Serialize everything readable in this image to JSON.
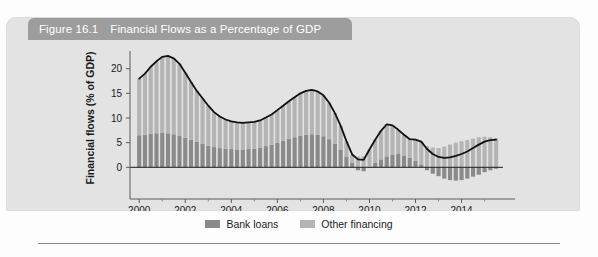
{
  "figure": {
    "number": "Figure 16.1",
    "title": "Financial Flows as a Percentage of GDP",
    "titlebar_color": "#9d9d9d",
    "card_color": "#e3e3e3"
  },
  "legend": {
    "position": "bottom-center",
    "items": [
      {
        "label": "Bank loans",
        "color": "#8a8a8a"
      },
      {
        "label": "Other financing",
        "color": "#b4b4b4"
      }
    ]
  },
  "chart_data": {
    "type": "bar",
    "stacked": true,
    "title": "Financial Flows as a Percentage of GDP",
    "xlabel": "",
    "ylabel": "Financial flows (% of GDP)",
    "xlim": [
      1999.6,
      2015.8
    ],
    "ylim": [
      -4,
      24
    ],
    "yticks": [
      0,
      5,
      10,
      15,
      20
    ],
    "ytick_labels": [
      "0",
      "5",
      "10",
      "15",
      "20"
    ],
    "xticks": [
      2000,
      2002,
      2004,
      2006,
      2008,
      2010,
      2012,
      2014
    ],
    "xtick_labels": [
      "2000",
      "2002",
      "2004",
      "2006",
      "2008",
      "2010",
      "2012",
      "2014"
    ],
    "grid": false,
    "zero_line": true,
    "overlay_line": {
      "name": "Total financial flows",
      "color": "#111111",
      "width": 1.8
    },
    "x": [
      2000.0,
      2000.25,
      2000.5,
      2000.75,
      2001.0,
      2001.25,
      2001.5,
      2001.75,
      2002.0,
      2002.25,
      2002.5,
      2002.75,
      2003.0,
      2003.25,
      2003.5,
      2003.75,
      2004.0,
      2004.25,
      2004.5,
      2004.75,
      2005.0,
      2005.25,
      2005.5,
      2005.75,
      2006.0,
      2006.25,
      2006.5,
      2006.75,
      2007.0,
      2007.25,
      2007.5,
      2007.75,
      2008.0,
      2008.25,
      2008.5,
      2008.75,
      2009.0,
      2009.25,
      2009.5,
      2009.75,
      2010.0,
      2010.25,
      2010.5,
      2010.75,
      2011.0,
      2011.25,
      2011.5,
      2011.75,
      2012.0,
      2012.25,
      2012.5,
      2012.75,
      2013.0,
      2013.25,
      2013.5,
      2013.75,
      2014.0,
      2014.25,
      2014.5,
      2014.75,
      2015.0,
      2015.25,
      2015.5
    ],
    "series": [
      {
        "name": "Bank loans",
        "color": "#8a8a8a",
        "values": [
          6.5,
          6.6,
          6.8,
          6.9,
          7.0,
          6.9,
          6.7,
          6.4,
          6.0,
          5.6,
          5.2,
          4.8,
          4.4,
          4.1,
          3.9,
          3.8,
          3.7,
          3.6,
          3.6,
          3.7,
          3.8,
          4.0,
          4.3,
          4.6,
          5.0,
          5.4,
          5.8,
          6.1,
          6.4,
          6.6,
          6.7,
          6.6,
          6.3,
          5.7,
          4.8,
          3.6,
          2.2,
          0.9,
          -0.6,
          -0.8,
          0.1,
          0.9,
          1.6,
          2.2,
          2.6,
          2.7,
          2.4,
          1.9,
          1.3,
          0.6,
          -0.6,
          -1.3,
          -1.8,
          -2.3,
          -2.6,
          -2.7,
          -2.6,
          -2.3,
          -1.9,
          -1.5,
          -1.0,
          -0.6,
          -0.3
        ]
      },
      {
        "name": "Other financing",
        "color": "#b4b4b4",
        "values": [
          11.5,
          12.4,
          13.6,
          14.6,
          15.4,
          15.7,
          15.4,
          14.6,
          13.2,
          11.7,
          10.3,
          9.2,
          8.1,
          7.1,
          6.4,
          5.9,
          5.6,
          5.5,
          5.4,
          5.4,
          5.4,
          5.5,
          5.8,
          6.1,
          6.6,
          7.1,
          7.6,
          8.1,
          8.6,
          8.9,
          9.0,
          8.8,
          8.3,
          7.4,
          6.2,
          4.8,
          3.1,
          1.7,
          2.2,
          2.3,
          3.5,
          4.7,
          5.8,
          6.5,
          5.9,
          4.9,
          4.2,
          3.8,
          4.3,
          4.6,
          4.3,
          4.0,
          3.9,
          4.2,
          4.6,
          5.0,
          5.3,
          5.5,
          5.8,
          6.1,
          6.2,
          6.1,
          5.9
        ]
      }
    ],
    "total": [
      18.0,
      19.0,
      20.4,
      21.5,
      22.4,
      22.6,
      22.1,
      21.0,
      19.2,
      17.3,
      15.5,
      14.0,
      12.5,
      11.2,
      10.3,
      9.7,
      9.3,
      9.1,
      9.0,
      9.1,
      9.2,
      9.5,
      10.1,
      10.7,
      11.6,
      12.5,
      13.4,
      14.2,
      15.0,
      15.5,
      15.7,
      15.4,
      14.6,
      13.1,
      11.0,
      8.4,
      5.3,
      2.6,
      1.6,
      1.5,
      3.6,
      5.6,
      7.4,
      8.7,
      8.5,
      7.6,
      6.6,
      5.7,
      5.6,
      5.2,
      3.7,
      2.7,
      2.1,
      1.9,
      2.0,
      2.3,
      2.7,
      3.2,
      3.9,
      4.6,
      5.2,
      5.5,
      5.6
    ]
  }
}
